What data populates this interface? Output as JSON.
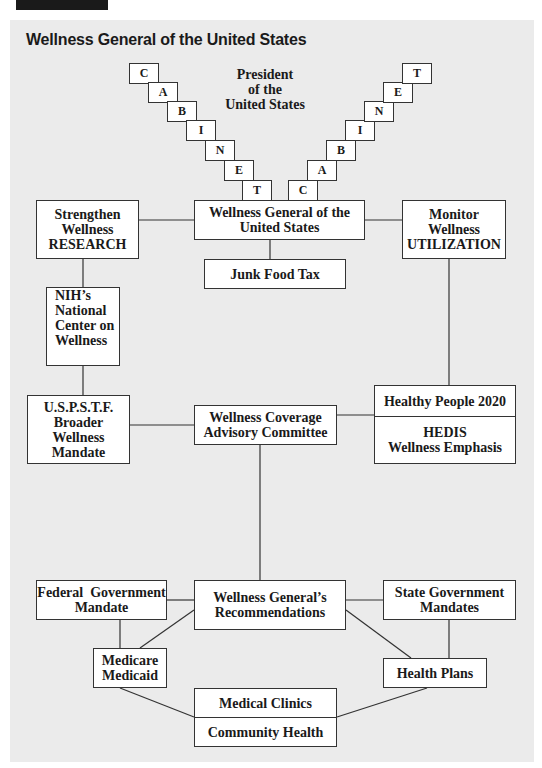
{
  "header": {
    "title": "Wellness General of the United States"
  },
  "president": {
    "line1": "President",
    "line2": "of the",
    "line3": "United States"
  },
  "cabinet_left": [
    "C",
    "A",
    "B",
    "I",
    "N",
    "E",
    "T"
  ],
  "cabinet_right": [
    "C",
    "A",
    "B",
    "I",
    "N",
    "E",
    "T"
  ],
  "nodes": {
    "wellness_general": {
      "line1": "Wellness General of the",
      "line2": "United States"
    },
    "junk_food_tax": {
      "label": "Junk Food Tax"
    },
    "strengthen_research": {
      "line1": "Strengthen",
      "line2": "Wellness",
      "line3": "RESEARCH"
    },
    "monitor_utilization": {
      "line1": "Monitor",
      "line2": "Wellness",
      "line3": "UTILIZATION"
    },
    "nih": {
      "line1": "NIH’s",
      "line2": "National",
      "line3": "Center on",
      "line4": "Wellness"
    },
    "uspstf": {
      "line1": "U.S.P.S.T.F.",
      "line2": "Broader",
      "line3": "Wellness",
      "line4": "Mandate"
    },
    "coverage_committee": {
      "line1": "Wellness Coverage",
      "line2": "Advisory Committee"
    },
    "healthy_people": {
      "label": "Healthy People 2020"
    },
    "hedis": {
      "line1": "HEDIS",
      "line2": "Wellness Emphasis"
    },
    "federal_mandate": {
      "line1": "Federal  Government",
      "line2": "Mandate"
    },
    "recommendations": {
      "line1": "Wellness General’s",
      "line2": "Recommendations"
    },
    "state_mandates": {
      "line1": "State Government",
      "line2": "Mandates"
    },
    "medicare": {
      "line1": "Medicare",
      "line2": "Medicaid"
    },
    "health_plans": {
      "label": "Health Plans"
    },
    "medical_clinics": {
      "label": "Medical Clinics"
    },
    "community_health": {
      "label": "Community Health"
    }
  },
  "colors": {
    "panel_bg": "#ebebeb",
    "box_bg": "#ffffff",
    "line": "#333333",
    "text": "#1a1a1a",
    "tab": "#1a1a1a"
  }
}
